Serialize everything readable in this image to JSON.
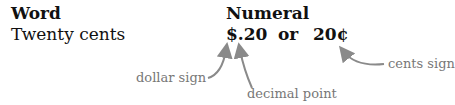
{
  "table": {
    "headers": {
      "word": "Word",
      "numeral": "Numeral"
    },
    "row": {
      "word": "Twenty cents",
      "numeral_dollar": "$.20",
      "connector": "or",
      "numeral_cents": "20¢"
    }
  },
  "annotations": {
    "dollar_sign": "dollar sign",
    "decimal_point": "decimal point",
    "cents_sign": "cents sign"
  },
  "colors": {
    "text": "#111111",
    "annotation": "#777777",
    "arrow": "#8a8a8a"
  }
}
